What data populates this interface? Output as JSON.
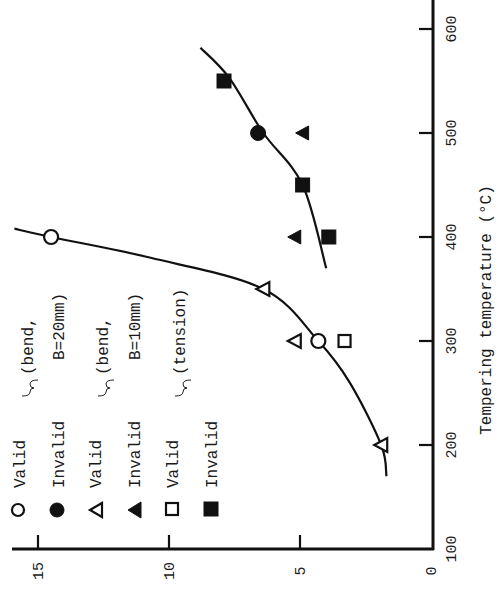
{
  "chart_data": {
    "type": "scatter",
    "orientation": "rotated-90-ccw",
    "title": "",
    "xlabel": "Tempering temperature (°C)",
    "ylabel": "",
    "xlim": [
      100,
      600
    ],
    "ylim": [
      0,
      15
    ],
    "x_ticks": [
      100,
      200,
      300,
      400,
      500,
      600
    ],
    "y_ticks": [
      0,
      5,
      10,
      15
    ],
    "grid": false,
    "legend_position": "upper-left (rotated)",
    "legend": [
      {
        "marker": "open-circle",
        "label": "Valid",
        "group": "(bend, B=20mm)"
      },
      {
        "marker": "filled-circle",
        "label": "Invalid",
        "group": "(bend, B=20mm)"
      },
      {
        "marker": "open-triangle",
        "label": "Valid",
        "group": "(bend, B=10mm)"
      },
      {
        "marker": "filled-triangle",
        "label": "Invalid",
        "group": "(bend, B=10mm)"
      },
      {
        "marker": "open-square",
        "label": "Valid",
        "group": "(tension)"
      },
      {
        "marker": "filled-square",
        "label": "Invalid",
        "group": "(tension)"
      }
    ],
    "series": [
      {
        "name": "Valid (bend, B=20mm)",
        "marker": "open-circle",
        "points": [
          {
            "x": 300,
            "y": 4.3
          },
          {
            "x": 400,
            "y": 14.5
          }
        ]
      },
      {
        "name": "Invalid (bend, B=20mm)",
        "marker": "filled-circle",
        "points": [
          {
            "x": 500,
            "y": 6.6
          }
        ]
      },
      {
        "name": "Valid (bend, B=10mm)",
        "marker": "open-triangle",
        "points": [
          {
            "x": 200,
            "y": 1.9
          },
          {
            "x": 300,
            "y": 5.2
          },
          {
            "x": 350,
            "y": 6.4
          }
        ]
      },
      {
        "name": "Invalid (bend, B=10mm)",
        "marker": "filled-triangle",
        "points": [
          {
            "x": 400,
            "y": 5.2
          },
          {
            "x": 500,
            "y": 4.9
          }
        ]
      },
      {
        "name": "Valid (tension)",
        "marker": "open-square",
        "points": [
          {
            "x": 300,
            "y": 3.3
          }
        ]
      },
      {
        "name": "Invalid (tension)",
        "marker": "filled-square",
        "points": [
          {
            "x": 400,
            "y": 3.9
          },
          {
            "x": 450,
            "y": 4.9
          },
          {
            "x": 550,
            "y": 7.9
          }
        ]
      }
    ],
    "fit_curves": [
      {
        "name": "low-temperature trend",
        "points": [
          {
            "x": 170,
            "y": 1.7
          },
          {
            "x": 200,
            "y": 1.9
          },
          {
            "x": 260,
            "y": 3.1
          },
          {
            "x": 300,
            "y": 4.3
          },
          {
            "x": 350,
            "y": 6.4
          },
          {
            "x": 380,
            "y": 10.7
          },
          {
            "x": 400,
            "y": 14.5
          },
          {
            "x": 408,
            "y": 15.9
          }
        ]
      },
      {
        "name": "high-temperature trend",
        "points": [
          {
            "x": 370,
            "y": 4.0
          },
          {
            "x": 450,
            "y": 4.9
          },
          {
            "x": 500,
            "y": 6.4
          },
          {
            "x": 553,
            "y": 7.7
          },
          {
            "x": 582,
            "y": 8.8
          }
        ]
      }
    ]
  },
  "axes": {
    "x_tick_labels": [
      "100",
      "200",
      "300",
      "400",
      "500",
      "600"
    ],
    "y_tick_labels": [
      "0",
      "5",
      "10",
      "15"
    ],
    "x_title": "Tempering temperature (°C)"
  },
  "legend_text": {
    "row1": "Valid",
    "row2": "Invalid",
    "row3": "Valid",
    "row4": "Invalid",
    "row5": "Valid",
    "row6": "Invalid",
    "group1a": "(bend,",
    "group1b": "B=20mm)",
    "group2a": "(bend,",
    "group2b": "B=10mm)",
    "group3": "(tension)"
  }
}
